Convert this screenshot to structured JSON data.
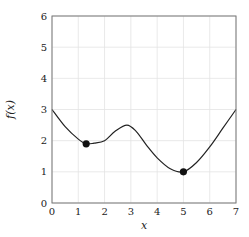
{
  "chart_data": {
    "type": "line",
    "title": "",
    "xlabel": "x",
    "ylabel": "f(x)",
    "xlim": [
      0,
      7
    ],
    "ylim": [
      0,
      6
    ],
    "xticks": [
      0,
      1,
      2,
      3,
      4,
      5,
      6,
      7
    ],
    "yticks": [
      0,
      1,
      2,
      3,
      4,
      5,
      6
    ],
    "grid": true,
    "legend": null,
    "series": [
      {
        "name": "f(x)",
        "color": "#222222",
        "x": [
          0,
          0.5,
          1.0,
          1.3,
          1.6,
          2.0,
          2.4,
          2.85,
          3.2,
          3.6,
          4.0,
          4.5,
          5.0,
          5.5,
          6.0,
          6.5,
          7.0
        ],
        "y": [
          3.0,
          2.45,
          2.05,
          1.9,
          1.92,
          2.0,
          2.3,
          2.5,
          2.3,
          1.85,
          1.45,
          1.1,
          1.0,
          1.3,
          1.8,
          2.4,
          3.0
        ]
      }
    ],
    "markers": [
      {
        "label": "local minimum",
        "x": 1.3,
        "y": 1.9,
        "color": "#111111"
      },
      {
        "label": "global minimum",
        "x": 5.0,
        "y": 1.0,
        "color": "#111111"
      }
    ]
  },
  "labels": {
    "xlabel": "x",
    "ylabel": "f(x)",
    "xticks": [
      "0",
      "1",
      "2",
      "3",
      "4",
      "5",
      "6",
      "7"
    ],
    "yticks": [
      "0",
      "1",
      "2",
      "3",
      "4",
      "5",
      "6"
    ]
  }
}
